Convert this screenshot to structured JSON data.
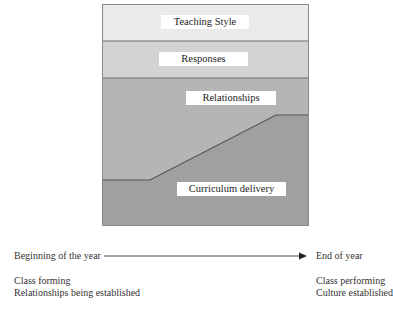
{
  "diagram": {
    "colors": {
      "band_teaching_style": "#eaeaea",
      "band_responses": "#d3d3d3",
      "band_relationships": "#b5b5b5",
      "band_curriculum": "#a0a0a0",
      "border": "#6e6e6e"
    },
    "bands": [
      {
        "id": "teaching-style",
        "label": "Teaching Style"
      },
      {
        "id": "responses",
        "label": "Responses"
      },
      {
        "id": "relationships",
        "label": "Relationships"
      },
      {
        "id": "curriculum-delivery",
        "label": "Curriculum delivery"
      }
    ]
  },
  "timeline": {
    "start_label": "Beginning of the year",
    "end_label": "End of year",
    "start_notes": [
      "Class forming",
      "Relationships being established"
    ],
    "end_notes": [
      "Class performing",
      "Culture established"
    ]
  }
}
